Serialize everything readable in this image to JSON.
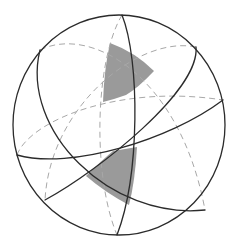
{
  "figure": {
    "title": "Spherical triangles on a sphere formed by intersecting great circles",
    "colors": {
      "outline": "#2b2b2b",
      "hidden_line": "#a8a8a8",
      "shade": "#9a9a9a",
      "background": "#ffffff"
    },
    "sphere": {
      "cx": 119,
      "cy": 125,
      "r": 106
    },
    "great_circles": [
      {
        "id": "gc-vertical",
        "front": "solid",
        "back": "dashed"
      },
      {
        "id": "gc-upper-left-diagonal",
        "front": "solid",
        "back": "dashed"
      },
      {
        "id": "gc-upper-right-diagonal",
        "front": "solid",
        "back": "dashed"
      },
      {
        "id": "gc-horizontal",
        "front": "solid",
        "back": "dashed"
      }
    ],
    "shaded_regions": [
      {
        "id": "upper-triangle",
        "side": "back"
      },
      {
        "id": "lower-triangle",
        "side": "front"
      }
    ]
  }
}
